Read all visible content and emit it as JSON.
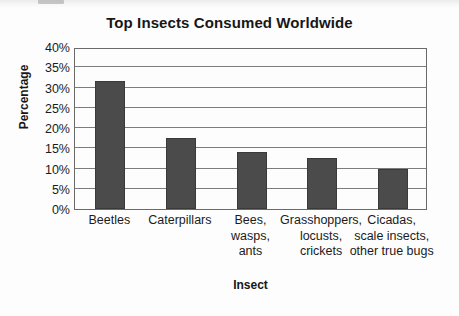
{
  "chart_data": {
    "type": "bar",
    "title": "Top Insects Consumed Worldwide",
    "xlabel": "Insect",
    "ylabel": "Percentage",
    "categories": [
      "Beetles",
      "Caterpillars",
      "Bees,\nwasps,\nants",
      "Grasshoppers,\nlocusts,\ncrickets",
      "Cicadas,\nscale insects,\nother true bugs"
    ],
    "values": [
      31.5,
      17.5,
      14,
      12.5,
      10
    ],
    "value_labels": [
      "31.5%",
      "17.5%",
      "14%",
      "12.5%",
      "10%"
    ],
    "ylim": [
      0,
      40
    ],
    "ytick_step": 5,
    "ytick_labels": [
      "40%",
      "35%",
      "30%",
      "25%",
      "20%",
      "15%",
      "10%",
      "5%",
      "0%"
    ],
    "ytick_values": [
      40,
      35,
      30,
      25,
      20,
      15,
      10,
      5,
      0
    ],
    "grid": true,
    "grid_axis": "y",
    "legend": false,
    "bar_color": "#4b4b4b",
    "plot_border_color": "#6a6a6a",
    "gridline_color": "#7d7d7d",
    "background_color": "#fdfdfd",
    "text_color": "#1b1b1b"
  }
}
